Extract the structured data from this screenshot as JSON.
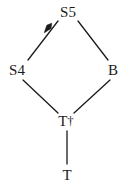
{
  "figure": {
    "kind": "hasse-diagram",
    "background_color": "#ffffff",
    "stroke_color": "#1a1a1a",
    "width": 131,
    "height": 188
  },
  "nodes": [
    {
      "id": "s5",
      "label": "S5",
      "x": 68,
      "y": 12
    },
    {
      "id": "s4",
      "label": "S4",
      "x": 17,
      "y": 70
    },
    {
      "id": "b",
      "label": "B",
      "x": 113,
      "y": 70
    },
    {
      "id": "tdagger",
      "label": "T",
      "mark": "†",
      "x": 66,
      "y": 121
    },
    {
      "id": "t",
      "label": "T",
      "x": 67,
      "y": 175
    }
  ],
  "edges": [
    {
      "id": "s4-s5",
      "from": "S4",
      "to": "S5",
      "x1": 28,
      "y1": 60,
      "x2": 58,
      "y2": 21,
      "marker": "arrowhead"
    },
    {
      "id": "s5-b",
      "from": "S5",
      "to": "B",
      "x1": 78,
      "y1": 21,
      "x2": 108,
      "y2": 60,
      "marker": "none"
    },
    {
      "id": "s4-tdagger",
      "from": "S4",
      "to": "T",
      "x1": 23,
      "y1": 80,
      "x2": 58,
      "y2": 113,
      "marker": "none"
    },
    {
      "id": "b-tdagger",
      "from": "B",
      "to": "T",
      "x1": 110,
      "y1": 80,
      "x2": 74,
      "y2": 113,
      "marker": "none"
    },
    {
      "id": "tdagger-t",
      "from": "T",
      "to": "T",
      "x1": 67,
      "y1": 131,
      "x2": 67,
      "y2": 164,
      "marker": "none"
    }
  ],
  "arrow_marker": {
    "id": "s4-s5-arrowhead",
    "cx": 48,
    "cy": 28,
    "rotation_deg": -52
  }
}
